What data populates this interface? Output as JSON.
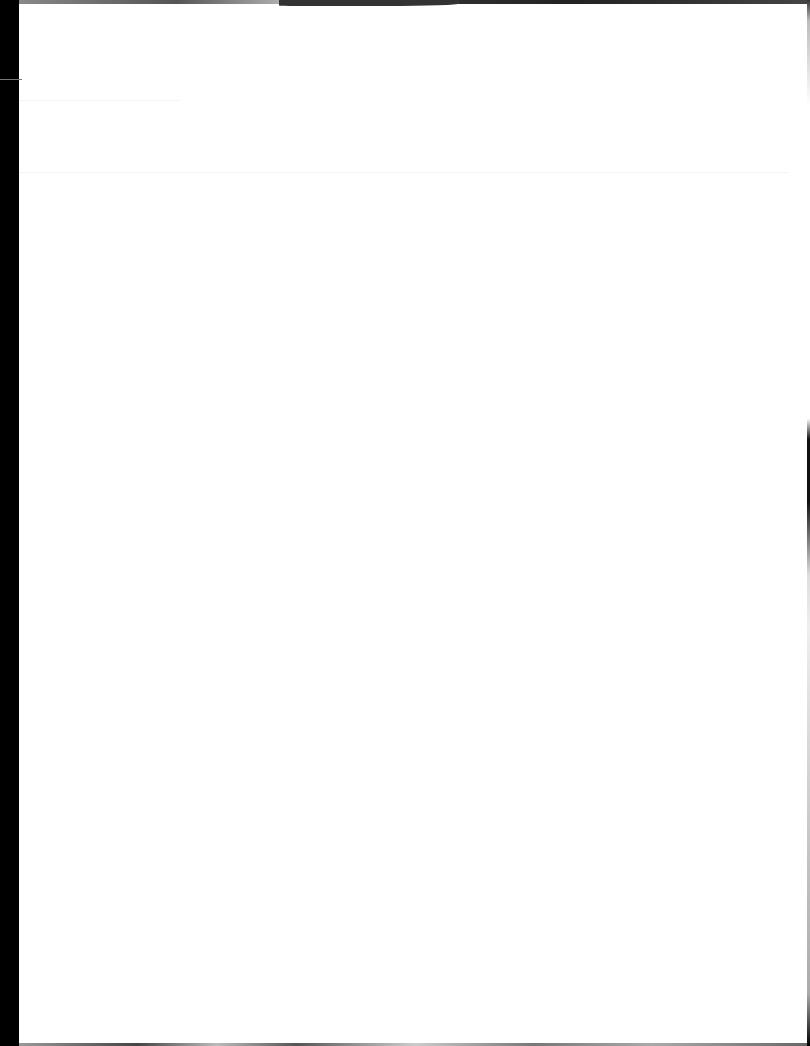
{
  "document": {
    "type": "scanned-page",
    "content": "",
    "colors": {
      "paper": "#ffffff",
      "scan_border": "#000000"
    }
  }
}
